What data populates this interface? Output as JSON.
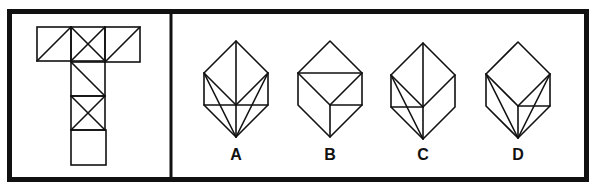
{
  "puzzle": {
    "question_panel": {
      "net": {
        "squares": [
          {
            "id": "top-left",
            "x": 37,
            "y": 27,
            "size": 34,
            "diagonals": [
              "bl-tr"
            ]
          },
          {
            "id": "top-middle",
            "x": 71,
            "y": 27,
            "size": 34,
            "diagonals": [
              "bl-tr",
              "tl-br"
            ]
          },
          {
            "id": "top-right",
            "x": 105,
            "y": 27,
            "size": 35,
            "diagonals": [
              "bl-tr"
            ]
          },
          {
            "id": "column-2",
            "x": 71,
            "y": 62,
            "size": 34,
            "diagonals": [
              "tl-br"
            ]
          },
          {
            "id": "column-3",
            "x": 71,
            "y": 96,
            "size": 34,
            "diagonals": [
              "bl-tr",
              "tl-br"
            ]
          },
          {
            "id": "column-4",
            "x": 71,
            "y": 130,
            "size": 35,
            "diagonals": []
          }
        ]
      }
    },
    "options": [
      {
        "label": "A",
        "origin": [
          236,
          41
        ],
        "label_pos": [
          221,
          147
        ],
        "lines": [
          [
            "T",
            "B"
          ],
          [
            "L",
            "C"
          ],
          [
            "R",
            "C"
          ],
          [
            "BL",
            "BR"
          ],
          [
            "L",
            "B"
          ],
          [
            "R",
            "B"
          ]
        ]
      },
      {
        "label": "B",
        "origin": [
          330,
          41
        ],
        "label_pos": [
          315,
          147
        ],
        "lines": [
          [
            "L",
            "R"
          ],
          [
            "L",
            "C"
          ],
          [
            "R",
            "C"
          ],
          [
            "C",
            "B"
          ],
          [
            "C",
            "BR"
          ]
        ]
      },
      {
        "label": "C",
        "origin": [
          423,
          43
        ],
        "label_pos": [
          408,
          147
        ],
        "lines": [
          [
            "T",
            "B"
          ],
          [
            "L",
            "C"
          ],
          [
            "R",
            "C"
          ],
          [
            "BL",
            "C"
          ],
          [
            "L",
            "B"
          ]
        ]
      },
      {
        "label": "D",
        "origin": [
          518,
          42
        ],
        "label_pos": [
          503,
          147
        ],
        "lines": [
          [
            "L",
            "C"
          ],
          [
            "R",
            "C"
          ],
          [
            "C",
            "B"
          ],
          [
            "C",
            "BR"
          ],
          [
            "L",
            "B"
          ],
          [
            "R",
            "B"
          ]
        ]
      }
    ]
  },
  "colors": {
    "ink": "#111111",
    "background": "#ffffff"
  }
}
